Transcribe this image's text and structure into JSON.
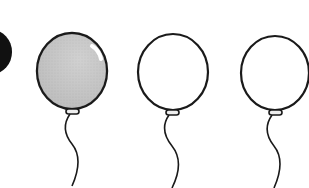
{
  "scene": {
    "description": "Worksheet illustration of balloons",
    "background": "#ffffff",
    "outline_color": "#1a1a1a",
    "partial_shape": {
      "name": "partial-black-circle",
      "color": "#111111",
      "cx": -8,
      "cy": 52,
      "rx": 20,
      "ry": 22
    },
    "balloons": [
      {
        "name": "balloon-shaded",
        "fill": "#c4c4c4",
        "shaded": true,
        "cx": 72,
        "cy": 71,
        "rx": 35,
        "ry": 38,
        "knot_y": 113
      },
      {
        "name": "balloon-empty-1",
        "fill": "#ffffff",
        "shaded": false,
        "cx": 173,
        "cy": 72,
        "rx": 35,
        "ry": 38,
        "knot_y": 114
      },
      {
        "name": "balloon-empty-2",
        "fill": "#ffffff",
        "shaded": false,
        "cx": 275,
        "cy": 73,
        "rx": 34,
        "ry": 37,
        "knot_y": 114
      }
    ]
  }
}
